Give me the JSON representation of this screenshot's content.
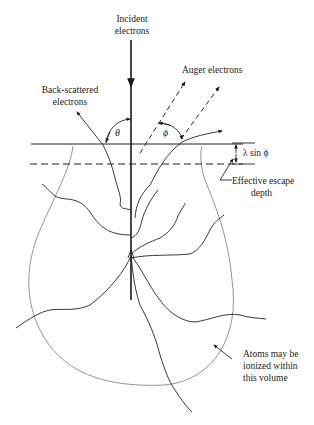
{
  "diagram": {
    "labels": {
      "incident_line1": "Incident",
      "incident_line2": "electrons",
      "auger": "Auger electrons",
      "backscatter_line1": "Back-scattered",
      "backscatter_line2": "electrons",
      "theta": "θ",
      "phi": "ϕ",
      "escape_expr": "λ sin ϕ",
      "escape_line1": "Effective escape",
      "escape_line2": "depth",
      "volume_line1": "Atoms may be",
      "volume_line2": "ionized within",
      "volume_line3": "this volume"
    },
    "nodes": [
      {
        "id": "incident-beam",
        "label": "Incident electrons"
      },
      {
        "id": "auger-electrons",
        "label": "Auger electrons"
      },
      {
        "id": "backscattered-electrons",
        "label": "Back-scattered electrons"
      },
      {
        "id": "escape-depth",
        "label": "Effective escape depth"
      },
      {
        "id": "interaction-volume",
        "label": "Atoms may be ionized within this volume"
      }
    ],
    "colors": {
      "ink": "#222222",
      "volume_outline": "#666666",
      "background": "#ffffff"
    }
  }
}
